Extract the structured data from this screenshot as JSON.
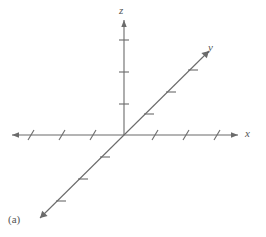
{
  "figure": {
    "caption": "(a)",
    "background_color": "#ffffff",
    "stroke_color": "#6b6b6b",
    "label_color": "#555555",
    "width": 266,
    "height": 237
  },
  "axes": [
    {
      "name": "z-axis",
      "label": "z",
      "orientation": "vertical",
      "origin": {
        "x": 124,
        "y": 135
      },
      "positive_end": {
        "x": 124,
        "y": 20
      },
      "negative_end": null,
      "arrowhead": "positive",
      "tick_style": "horizontal-dash",
      "tick_count_positive": 3,
      "tick_count_negative": 0,
      "tick_positions_positive": [
        40,
        72,
        104
      ]
    },
    {
      "name": "x-axis",
      "label": "x",
      "orientation": "horizontal",
      "origin": {
        "x": 124,
        "y": 135
      },
      "positive_end": {
        "x": 238,
        "y": 135
      },
      "negative_end": {
        "x": 12,
        "y": 135
      },
      "arrowhead": "both",
      "tick_style": "slanted-dash",
      "tick_count_positive": 3,
      "tick_count_negative": 3,
      "tick_positions_positive": [
        155,
        186,
        217
      ],
      "tick_positions_negative": [
        93,
        62,
        31
      ]
    },
    {
      "name": "y-axis",
      "label": "y",
      "orientation": "diagonal",
      "origin": {
        "x": 124,
        "y": 135
      },
      "positive_end": {
        "x": 209,
        "y": 51
      },
      "negative_end": {
        "x": 40,
        "y": 218
      },
      "arrowhead": "both",
      "tick_style": "horizontal-dash",
      "tick_count_positive": 3,
      "tick_count_negative": 3,
      "tick_fractions": [
        0.28,
        0.54,
        0.8
      ]
    }
  ]
}
